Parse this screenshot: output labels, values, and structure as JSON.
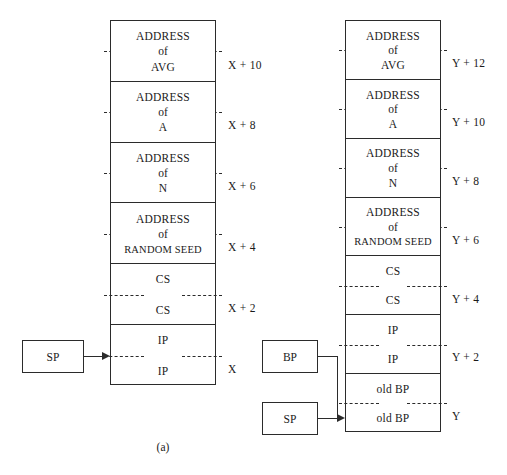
{
  "figure": {
    "caption": "(a)"
  },
  "left_stack": {
    "name": "stack-frame-a",
    "cells": [
      {
        "top": "ADDRESS",
        "mid": "of",
        "bottom": "AVG",
        "offset": "X + 10",
        "split": true,
        "long": false
      },
      {
        "top": "ADDRESS",
        "mid": "of",
        "bottom": "A",
        "offset": "X + 8",
        "split": true,
        "long": false
      },
      {
        "top": "ADDRESS",
        "mid": "of",
        "bottom": "N",
        "offset": "X + 6",
        "split": true,
        "long": false
      },
      {
        "top": "ADDRESS",
        "mid": "of",
        "bottom": "RANDOM SEED",
        "offset": "X + 4",
        "split": true,
        "long": true
      },
      {
        "top": "CS",
        "mid": "",
        "bottom": "CS",
        "offset": "X + 2",
        "split": true,
        "long": false
      },
      {
        "top": "IP",
        "mid": "",
        "bottom": "IP",
        "offset": "X",
        "split": true,
        "long": false
      }
    ]
  },
  "right_stack": {
    "name": "stack-frame-b",
    "cells": [
      {
        "top": "ADDRESS",
        "mid": "of",
        "bottom": "AVG",
        "offset": "Y + 12",
        "split": true,
        "long": false
      },
      {
        "top": "ADDRESS",
        "mid": "of",
        "bottom": "A",
        "offset": "Y + 10",
        "split": true,
        "long": false
      },
      {
        "top": "ADDRESS",
        "mid": "of",
        "bottom": "N",
        "offset": "Y + 8",
        "split": true,
        "long": false
      },
      {
        "top": "ADDRESS",
        "mid": "of",
        "bottom": "RANDOM SEED",
        "offset": "Y + 6",
        "split": true,
        "long": true
      },
      {
        "top": "CS",
        "mid": "",
        "bottom": "CS",
        "offset": "Y + 4",
        "split": true,
        "long": false
      },
      {
        "top": "IP",
        "mid": "",
        "bottom": "IP",
        "offset": "Y + 2",
        "split": true,
        "long": false
      },
      {
        "top": "old BP",
        "mid": "",
        "bottom": "old BP",
        "offset": "Y",
        "split": true,
        "long": false
      }
    ]
  },
  "registers": {
    "left_sp": "SP",
    "right_bp": "BP",
    "right_sp": "SP"
  },
  "colors": {
    "stroke": "#2b2b2b",
    "background": "#ffffff",
    "text": "#1a1a1a"
  }
}
